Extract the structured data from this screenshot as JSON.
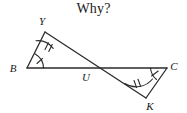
{
  "title": {
    "text": "Why?"
  },
  "figure": {
    "name": "bowtie-triangles-diagram",
    "stroke_color": "#2b2b2b",
    "background": "#ffffff",
    "stroke_width": 1.3,
    "vertices": [
      {
        "id": "B",
        "label": "B",
        "x": 27,
        "y": 68,
        "label_x": 13,
        "label_y": 72
      },
      {
        "id": "Y",
        "label": "Y",
        "x": 45,
        "y": 32,
        "label_x": 42,
        "label_y": 25
      },
      {
        "id": "U",
        "label": "U",
        "x": 88,
        "y": 68,
        "label_x": 84,
        "label_y": 80
      },
      {
        "id": "C",
        "label": "C",
        "x": 167,
        "y": 68,
        "label_x": 172,
        "label_y": 70
      },
      {
        "id": "K",
        "label": "K",
        "x": 146,
        "y": 98,
        "label_x": 148,
        "label_y": 109
      }
    ],
    "segments": [
      {
        "name": "segment-BC",
        "from": "B",
        "to": "C"
      },
      {
        "name": "segment-BY",
        "from": "B",
        "to": "Y"
      },
      {
        "name": "segment-YK",
        "from": "Y",
        "to": "K"
      },
      {
        "name": "segment-CK",
        "from": "C",
        "to": "K"
      }
    ],
    "angle_marks": [
      {
        "name": "angle-mark-B",
        "at": "B",
        "ticks": 1
      },
      {
        "name": "angle-mark-Y",
        "at": "Y",
        "ticks": 2
      },
      {
        "name": "angle-mark-C",
        "at": "C",
        "ticks": 1
      },
      {
        "name": "angle-mark-K",
        "at": "K",
        "ticks": 2
      }
    ]
  }
}
